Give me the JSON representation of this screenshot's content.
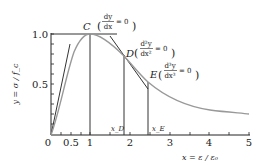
{
  "diagram": {
    "type": "stress-strain-curve",
    "y_axis": {
      "label": "y = σ / f_c",
      "ticks": [
        {
          "value": 0,
          "label": "0"
        },
        {
          "value": 0.5,
          "label": "0.5"
        },
        {
          "value": 1.0,
          "label": "1.0"
        }
      ],
      "range": [
        0,
        1.05
      ]
    },
    "x_axis": {
      "label": "x = ε / ε₀",
      "ticks": [
        {
          "value": 0,
          "label": "0"
        },
        {
          "value": 0.5,
          "label": "0.5"
        },
        {
          "value": 1,
          "label": "1"
        },
        {
          "value": 2,
          "label": "2"
        },
        {
          "value": 3,
          "label": "3"
        },
        {
          "value": 4,
          "label": "4"
        },
        {
          "value": 5,
          "label": "5"
        }
      ],
      "range": [
        0,
        5
      ]
    },
    "points": {
      "C": {
        "label": "C",
        "condition_num": "dy",
        "condition_den": "dx",
        "condition_rhs": "= 0",
        "x": 1.0,
        "y": 1.0
      },
      "D": {
        "label": "D",
        "condition_num": "d²y",
        "condition_den": "dx²",
        "condition_rhs": "= 0",
        "x": 1.87,
        "y": 0.75
      },
      "E": {
        "label": "E",
        "condition_num": "d³y",
        "condition_den": "dx³",
        "condition_rhs": "= 0",
        "x": 2.45,
        "y": 0.55
      }
    },
    "markers": {
      "x_D": "x_D",
      "x_E": "x_E"
    },
    "colors": {
      "axis": "#222222",
      "curve": "#999999",
      "lines": "#333333"
    }
  }
}
